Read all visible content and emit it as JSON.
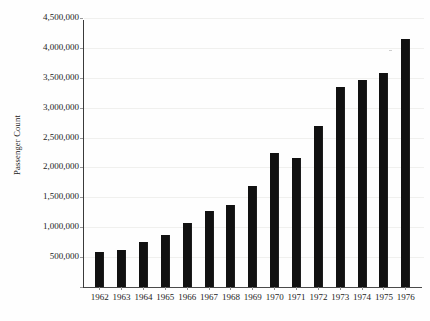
{
  "chart_data": {
    "type": "bar",
    "title": "",
    "xlabel": "",
    "ylabel": "Passenger Count",
    "categories": [
      "1962",
      "1963",
      "1964",
      "1965",
      "1966",
      "1967",
      "1968",
      "1969",
      "1970",
      "1971",
      "1972",
      "1973",
      "1974",
      "1975",
      "1976"
    ],
    "values": [
      580000,
      620000,
      760000,
      870000,
      1075000,
      1270000,
      1370000,
      1690000,
      2250000,
      2155000,
      2690000,
      3350000,
      3455000,
      3580000,
      4145000
    ],
    "ylim": [
      0,
      4500000
    ],
    "ytick_values": [
      500000,
      1000000,
      1500000,
      2000000,
      2500000,
      3000000,
      3500000,
      4000000,
      4500000
    ],
    "ytick_labels": [
      "500,000",
      "1,000,000",
      "1,500,000",
      "2,000,000",
      "2,500,000",
      "3,000,000",
      "3,500,000",
      "4,000,000",
      "4,500,000"
    ],
    "grid": true,
    "grid_axis": "y",
    "legend": false,
    "legend_position": "none",
    "bar_color": "#111111",
    "background_color": "#fefefe",
    "axis_color": "#3a3a3a",
    "gridline_color": "#f0f0ee"
  },
  "axes": {
    "y_title": "Passenger Count"
  }
}
